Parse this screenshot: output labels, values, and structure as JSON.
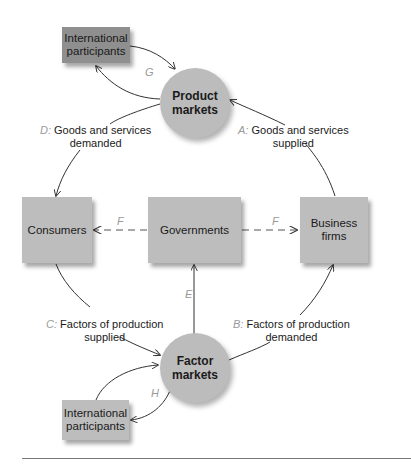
{
  "diagram": {
    "nodes": {
      "intl_top": {
        "label": "International participants",
        "line1": "International",
        "line2": "participants"
      },
      "product_markets": {
        "line1": "Product",
        "line2": "markets"
      },
      "consumers": {
        "label": "Consumers"
      },
      "governments": {
        "label": "Governments"
      },
      "business_firms": {
        "line1": "Business",
        "line2": "firms"
      },
      "factor_markets": {
        "line1": "Factor",
        "line2": "markets"
      },
      "intl_bottom": {
        "line1": "International",
        "line2": "participants"
      }
    },
    "flows": {
      "A": {
        "letter": "A:",
        "line1": "Goods and services",
        "line2": "supplied"
      },
      "B": {
        "letter": "B:",
        "line1": "Factors of production",
        "line2": "demanded"
      },
      "C": {
        "letter": "C:",
        "line1": "Factors of production",
        "line2": "supplied"
      },
      "D": {
        "letter": "D:",
        "line1": "Goods and services",
        "line2": "demanded"
      },
      "E": {
        "letter": "E"
      },
      "F_left": {
        "letter": "F"
      },
      "F_right": {
        "letter": "F"
      },
      "G": {
        "letter": "G"
      },
      "H": {
        "letter": "H"
      }
    },
    "colors": {
      "node_fill": "#bdbdbd",
      "intl_top_fill": "#8f8f8f",
      "flow_letter": "#9a9a9a",
      "line": "#333333"
    }
  }
}
